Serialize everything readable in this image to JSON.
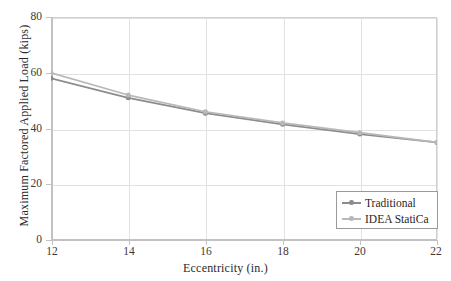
{
  "chart_data": {
    "type": "line",
    "title": "",
    "xlabel": "Eccentricity (in.)",
    "ylabel": "Maximum Factored Applied Load (kips)",
    "x": [
      12,
      14,
      16,
      18,
      20,
      22
    ],
    "xlim": [
      12,
      22
    ],
    "ylim": [
      0,
      80
    ],
    "xticks": [
      "12",
      "14",
      "16",
      "18",
      "20",
      "22"
    ],
    "yticks": [
      "0",
      "20",
      "40",
      "60",
      "80"
    ],
    "grid": true,
    "legend_position": "lower right",
    "series": [
      {
        "name": "Traditional",
        "color": "#8c8c8c",
        "marker": "circle",
        "values": [
          58.0,
          51.0,
          45.5,
          41.5,
          38.0,
          35.0
        ]
      },
      {
        "name": "IDEA StatiCa",
        "color": "#b8b8b8",
        "marker": "circle",
        "values": [
          60.0,
          52.0,
          46.0,
          42.0,
          38.5,
          35.0
        ]
      }
    ]
  },
  "axes": {
    "x_title": "Eccentricity (in.)",
    "y_title": "Maximum Factored Applied Load (kips)",
    "x_tick_labels": [
      "12",
      "14",
      "16",
      "18",
      "20",
      "22"
    ],
    "y_tick_labels": [
      "0",
      "20",
      "40",
      "60",
      "80"
    ]
  },
  "legend": {
    "items": [
      {
        "label": "Traditional",
        "color": "#8c8c8c"
      },
      {
        "label": "IDEA StatiCa",
        "color": "#b8b8b8"
      }
    ]
  },
  "colors": {
    "traditional": "#8c8c8c",
    "idea_statica": "#b8b8b8",
    "grid": "#e2e2e2",
    "axis": "#c2c2c2",
    "frame": "#cfcfcf",
    "text": "#2b2b2b",
    "background": "#ffffff"
  }
}
